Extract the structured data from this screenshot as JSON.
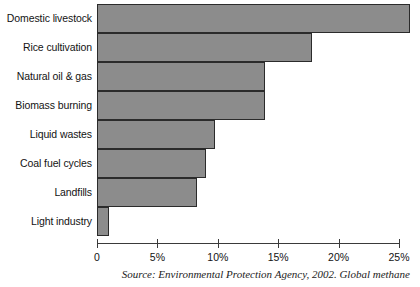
{
  "chart_data": {
    "type": "bar",
    "orientation": "horizontal",
    "title": "",
    "xlabel": "",
    "ylabel": "",
    "categories": [
      "Domestic livestock",
      "Rice cultivation",
      "Natural oil & gas",
      "Biomass burning",
      "Liquid wastes",
      "Coal fuel cycles",
      "Landfills",
      "Light industry"
    ],
    "values": [
      25.9,
      17.8,
      13.9,
      13.9,
      9.8,
      9.0,
      8.3,
      1.0
    ],
    "value_unit": "%",
    "xlim": [
      0,
      25
    ],
    "xticks": [
      0,
      5,
      10,
      15,
      20,
      25
    ],
    "xtick_labels": [
      "0",
      "5%",
      "10%",
      "15%",
      "20%",
      "25%"
    ],
    "grid": false,
    "legend": null,
    "bar_color": "#8c8c8c",
    "bar_border_color": "#2b2b2b",
    "axis_color": "#3a3a3a",
    "caption": "Source: Environmental Protection Agency, 2002. Global methane"
  }
}
